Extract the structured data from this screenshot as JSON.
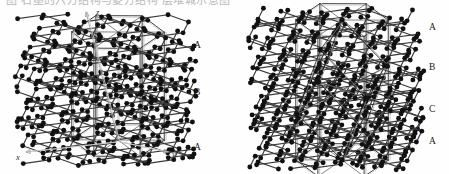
{
  "figure": {
    "caption_cropped": "图  石墨的六方结构与菱方结构  层堆城示意图",
    "background_color": "#fefefe",
    "atom_color": "#111111",
    "bond_color": "#3a3a3a",
    "cell_edge_color": "#9a9a9a",
    "axis_color": "#b0b0b0"
  },
  "left_panel": {
    "name": "hexagonal-graphite-ABA",
    "stacking": "ABA",
    "axes": [
      {
        "id": "z",
        "label": "z",
        "x": 96,
        "y": 15
      },
      {
        "id": "x",
        "label": "x",
        "x": 16,
        "y": 160
      },
      {
        "id": "y",
        "label": "y",
        "x": 172,
        "y": 157
      }
    ],
    "layer_labels": [
      {
        "label": "A",
        "x": 194,
        "y": 48
      },
      {
        "label": "B",
        "x": 194,
        "y": 95
      },
      {
        "label": "A",
        "x": 194,
        "y": 150
      }
    ]
  },
  "right_panel": {
    "name": "rhombohedral-graphite-ABC",
    "stacking": "ABC",
    "layer_labels": [
      {
        "label": "A",
        "x": 429,
        "y": 30
      },
      {
        "label": "B",
        "x": 429,
        "y": 70
      },
      {
        "label": "C",
        "x": 429,
        "y": 112
      },
      {
        "label": "A",
        "x": 429,
        "y": 144
      }
    ]
  },
  "chart_data": {
    "type": "diagram",
    "panels": [
      {
        "name": "hexagonal",
        "stacking_sequence": [
          "A",
          "B",
          "A"
        ],
        "layer_count": 3,
        "unit_cell": "hexagonal prism",
        "axes_shown": [
          "x",
          "y",
          "z"
        ]
      },
      {
        "name": "rhombohedral",
        "stacking_sequence": [
          "A",
          "B",
          "C",
          "A"
        ],
        "layer_count": 4,
        "unit_cell": "rhombohedron inscribed in hexagonal prism",
        "axes_shown": []
      }
    ]
  }
}
